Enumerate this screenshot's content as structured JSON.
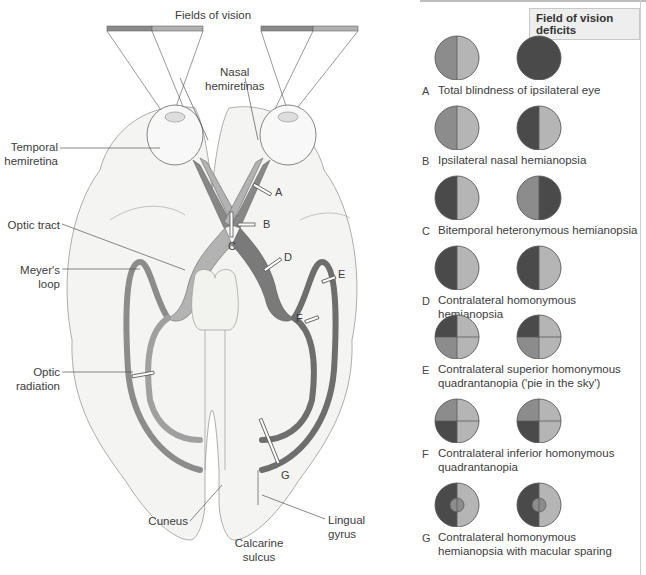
{
  "diagram": {
    "title": "Fields of vision",
    "labels": {
      "nasal_hemiretinas": [
        "Nasal",
        "hemiretinas"
      ],
      "temporal_hemiretina": [
        "Temporal",
        "hemiretina"
      ],
      "optic_tract": "Optic tract",
      "meyers_loop": [
        "Meyer's",
        "loop"
      ],
      "optic_radiation": [
        "Optic",
        "radiation"
      ],
      "cuneus": "Cuneus",
      "calcarine_sulcus": [
        "Calcarine",
        "sulcus"
      ],
      "lingual_gyrus": [
        "Lingual",
        "gyrus"
      ]
    },
    "lesion_markers": [
      "A",
      "B",
      "C",
      "D",
      "E",
      "F",
      "G"
    ]
  },
  "panel": {
    "title": "Field of vision deficits",
    "colors": {
      "temporal_field": "#8c8c8c",
      "nasal_field": "#b5b5b5",
      "blind": "#4a4a4a",
      "outline": "#5a5a5a"
    },
    "deficits": [
      {
        "letter": "A",
        "description": [
          "Total blindness of ipsilateral eye"
        ],
        "left_eye": {
          "pattern": "halves",
          "left": "temporal",
          "right": "nasal"
        },
        "right_eye": {
          "pattern": "full",
          "fill": "blind"
        }
      },
      {
        "letter": "B",
        "description": [
          "Ipsilateral nasal hemianopsia"
        ],
        "left_eye": {
          "pattern": "halves",
          "left": "temporal",
          "right": "nasal"
        },
        "right_eye": {
          "pattern": "halves",
          "left": "blind",
          "right": "nasal"
        }
      },
      {
        "letter": "C",
        "description": [
          "Bitemporal heteronymous hemianopsia"
        ],
        "left_eye": {
          "pattern": "halves",
          "left": "blind",
          "right": "nasal"
        },
        "right_eye": {
          "pattern": "halves",
          "left": "temporal",
          "right": "blind"
        }
      },
      {
        "letter": "D",
        "description": [
          "Contralateral homonymous hemianopsia"
        ],
        "left_eye": {
          "pattern": "halves",
          "left": "blind",
          "right": "nasal"
        },
        "right_eye": {
          "pattern": "halves",
          "left": "blind",
          "right": "nasal"
        }
      },
      {
        "letter": "E",
        "description": [
          "Contralateral superior homonymous",
          "quadrantanopia ('pie in the sky')"
        ],
        "left_eye": {
          "pattern": "quadrants",
          "tl": "blind",
          "tr": "nasal",
          "bl": "temporal",
          "br": "nasal"
        },
        "right_eye": {
          "pattern": "quadrants",
          "tl": "blind",
          "tr": "nasal",
          "bl": "temporal",
          "br": "nasal"
        }
      },
      {
        "letter": "F",
        "description": [
          "Contralateral inferior homonymous",
          "quadrantanopia"
        ],
        "left_eye": {
          "pattern": "quadrants",
          "tl": "temporal",
          "tr": "nasal",
          "bl": "blind",
          "br": "nasal"
        },
        "right_eye": {
          "pattern": "quadrants",
          "tl": "temporal",
          "tr": "nasal",
          "bl": "blind",
          "br": "nasal"
        }
      },
      {
        "letter": "G",
        "description": [
          "Contralateral homonymous",
          "hemianopsia with macular sparing"
        ],
        "left_eye": {
          "pattern": "macular",
          "left": "blind",
          "right": "nasal",
          "center": "temporal"
        },
        "right_eye": {
          "pattern": "macular",
          "left": "blind",
          "right": "nasal",
          "center": "temporal"
        }
      }
    ]
  }
}
